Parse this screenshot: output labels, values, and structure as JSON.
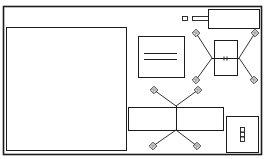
{
  "diagram": {
    "type": "component-layout",
    "colors": {
      "stroke": "#1c1c1c",
      "background": "#ffffff"
    },
    "outer_frame": {
      "x": 3,
      "y": 6,
      "w": 258,
      "h": 148
    },
    "left_panel": {
      "x": 6,
      "y": 27,
      "w": 120,
      "h": 123
    },
    "top_right_block": {
      "x": 208,
      "y": 9,
      "w": 51,
      "h": 19
    },
    "top_small_square": {
      "x": 182,
      "y": 16,
      "w": 5,
      "h": 4
    },
    "top_tab": {
      "x": 192,
      "y": 16,
      "w": 16,
      "h": 4
    },
    "middle_box": {
      "x": 138,
      "y": 36,
      "w": 46,
      "h": 41,
      "lines": [
        {
          "y": 53,
          "x1": 144,
          "x2": 177
        },
        {
          "y": 59,
          "x1": 144,
          "x2": 177
        }
      ]
    },
    "right_component": {
      "body": {
        "x": 214,
        "y": 40,
        "w": 23,
        "h": 35
      },
      "axis_y": 58,
      "left_node": {
        "x": 212,
        "y": 58
      },
      "right_node": {
        "x": 239,
        "y": 58
      },
      "pads": [
        {
          "x": 196,
          "y": 33
        },
        {
          "x": 255,
          "y": 33
        },
        {
          "x": 196,
          "y": 80
        },
        {
          "x": 254,
          "y": 80
        }
      ],
      "center_marks": [
        {
          "x": 224,
          "y": 58
        },
        {
          "x": 227,
          "y": 58
        }
      ]
    },
    "bottom_component": {
      "body": {
        "x": 128,
        "y": 107,
        "w": 95,
        "h": 23
      },
      "center_x": 176,
      "top_node": {
        "x": 176,
        "y": 106
      },
      "bottom_node": {
        "x": 176,
        "y": 130
      },
      "pads": [
        {
          "x": 154,
          "y": 90
        },
        {
          "x": 198,
          "y": 90
        },
        {
          "x": 153,
          "y": 146
        },
        {
          "x": 197,
          "y": 146
        }
      ]
    },
    "bottom_right_block": {
      "x": 226,
      "y": 116,
      "w": 32,
      "h": 36,
      "connector": {
        "x": 240,
        "y": 127,
        "w": 4,
        "h": 14,
        "cells": 3
      }
    }
  },
  "labels": {
    "outer_frame": "board outline",
    "left_panel": "large panel",
    "top_right_block": "connector block",
    "middle_box": "label plate",
    "right_component": "cross component",
    "bottom_component": "bar component",
    "bottom_right_block": "terminal block"
  }
}
